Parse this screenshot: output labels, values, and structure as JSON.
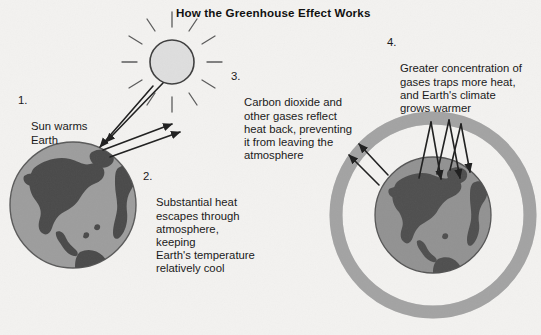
{
  "figure": {
    "title": "How the Greenhouse Effect Works",
    "background_color": "#f3f2f0",
    "text_color": "#1a1a1a"
  },
  "callouts": [
    {
      "number": "1.",
      "text": "Sun warms\nEarth",
      "name": "callout-sun-warms-earth"
    },
    {
      "number": "2.",
      "text": "Substantial heat\nescapes through\natmosphere, keeping\nEarth's temperature\nrelatively cool",
      "name": "callout-heat-escapes"
    },
    {
      "number": "3.",
      "text": "Carbon dioxide and\nother gases reflect\nheat back, preventing\nit from leaving the\natmosphere",
      "name": "callout-gases-reflect-heat"
    },
    {
      "number": "4.",
      "text": "Greater concentration of\ngases traps more heat,\nand Earth's climate\ngrows warmer",
      "name": "callout-climate-warms"
    }
  ],
  "graphics": {
    "sun": {
      "name": "sun-icon",
      "center_x": 172,
      "center_y": 62,
      "radius": 22,
      "fill": "#dcdcdc",
      "stroke": "#3a3a3a",
      "ray_count": 12
    },
    "earth_left": {
      "name": "earth-globe-left-icon",
      "center_x": 73,
      "center_y": 205,
      "radius": 63,
      "ocean_fill": "#9a9a9a",
      "land_fill": "#4a4a4a",
      "stroke": "#555555"
    },
    "earth_right": {
      "name": "earth-globe-right-icon",
      "center_x": 433,
      "center_y": 215,
      "radius": 58,
      "ocean_fill": "#8f8f8f",
      "land_fill": "#4f4f4f",
      "stroke": "#555555"
    },
    "atmosphere_ring": {
      "name": "atmosphere-ring",
      "center_x": 433,
      "center_y": 215,
      "radius": 97,
      "thickness": 13,
      "fill": "#a8a8a8"
    },
    "arrows": {
      "name": "heat-flow-arrows",
      "stroke": "#1f1f1f",
      "incoming_sunlight_count": 2,
      "escaping_heat_left_count": 2,
      "escaping_heat_right_count": 2,
      "reflected_heat_count": 3
    }
  }
}
